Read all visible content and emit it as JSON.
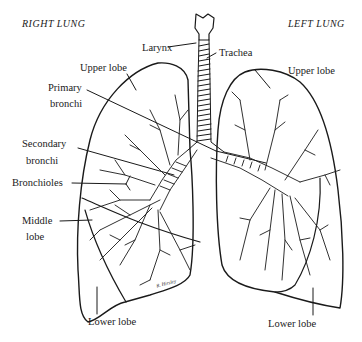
{
  "titles": {
    "right": "RIGHT LUNG",
    "left": "LEFT LUNG"
  },
  "labels": {
    "larynx": "Larynx",
    "trachea": "Trachea",
    "right_upper_lobe": "Upper lobe",
    "left_upper_lobe": "Upper lobe",
    "primary_bronchi_1": "Primary",
    "primary_bronchi_2": "bronchi",
    "secondary_bronchi_1": "Secondary",
    "secondary_bronchi_2": "bronchi",
    "bronchioles": "Bronchioles",
    "middle_lobe_1": "Middle",
    "middle_lobe_2": "lobe",
    "right_lower_lobe": "Lower lobe",
    "left_lower_lobe": "Lower lobe"
  },
  "signature": "R. Hirsley",
  "colors": {
    "ink": "#1a1a1a",
    "background": "#ffffff"
  }
}
